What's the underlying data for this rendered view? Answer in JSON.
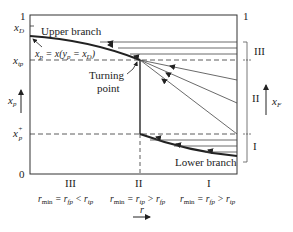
{
  "figure": {
    "left_axis": {
      "top_tick": "1",
      "xD": "x",
      "xD_sub": "D",
      "xtp": "x",
      "xtp_sub": "tp",
      "xp": "x",
      "xp_sub": "p",
      "xp_plus": "x",
      "xp_plus_sub": "p",
      "xp_plus_sup": "+",
      "zero": "0"
    },
    "right_axis": {
      "top_tick": "1",
      "xF": "x",
      "xF_sub": "F",
      "region_III": "III",
      "region_II": "II",
      "region_I": "I"
    },
    "annotations": {
      "upper_branch": "Upper branch",
      "lower_branch": "Lower branch",
      "turning_point_1": "Turning",
      "turning_point_2": "point",
      "equation": "x_p = x(y_p = x_D)"
    },
    "bottom": {
      "region_III": "III",
      "region_II": "II",
      "region_I": "I",
      "cond_III": "r_min = r_fp < r_tp",
      "cond_II": "r_min = r_tp > r_fp",
      "cond_I": "r_min = r_fp > r_tp",
      "r_label": "r"
    }
  }
}
